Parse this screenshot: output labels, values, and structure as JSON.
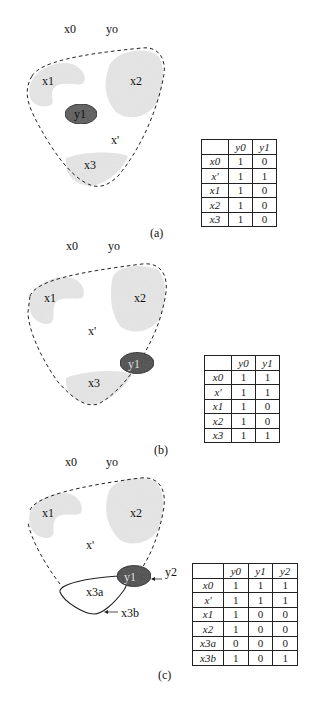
{
  "figure": {
    "panels": [
      {
        "id": "a",
        "caption": "(a)",
        "labels": {
          "x0": "x0",
          "yo": "yo",
          "x1": "x1",
          "x2": "x2",
          "y1": "y1",
          "xprime": "x'",
          "x3": "x3"
        },
        "table": {
          "columns": [
            "",
            "y0",
            "y1"
          ],
          "rows": [
            {
              "row": "x0",
              "values": [
                "1",
                "0"
              ]
            },
            {
              "row": "x'",
              "values": [
                "1",
                "1"
              ]
            },
            {
              "row": "x1",
              "values": [
                "1",
                "0"
              ]
            },
            {
              "row": "x2",
              "values": [
                "1",
                "0"
              ]
            },
            {
              "row": "x3",
              "values": [
                "1",
                "0"
              ]
            }
          ]
        }
      },
      {
        "id": "b",
        "caption": "(b)",
        "labels": {
          "x0": "x0",
          "yo": "yo",
          "x1": "x1",
          "x2": "x2",
          "y1": "y1",
          "xprime": "x'",
          "x3": "x3"
        },
        "table": {
          "columns": [
            "",
            "y0",
            "y1"
          ],
          "rows": [
            {
              "row": "x0",
              "values": [
                "1",
                "1"
              ]
            },
            {
              "row": "x'",
              "values": [
                "1",
                "1"
              ]
            },
            {
              "row": "x1",
              "values": [
                "1",
                "0"
              ]
            },
            {
              "row": "x2",
              "values": [
                "1",
                "0"
              ]
            },
            {
              "row": "x3",
              "values": [
                "1",
                "1"
              ]
            }
          ]
        }
      },
      {
        "id": "c",
        "caption": "(c)",
        "labels": {
          "x0": "x0",
          "yo": "yo",
          "x1": "x1",
          "x2": "x2",
          "y1": "y1",
          "y2": "y2",
          "xprime": "x'",
          "x3a": "x3a",
          "x3b": "x3b"
        },
        "table": {
          "columns": [
            "",
            "y0",
            "y1",
            "y2"
          ],
          "rows": [
            {
              "row": "x0",
              "values": [
                "1",
                "1",
                "1"
              ]
            },
            {
              "row": "x'",
              "values": [
                "1",
                "1",
                "1"
              ]
            },
            {
              "row": "x1",
              "values": [
                "1",
                "0",
                "0"
              ]
            },
            {
              "row": "x2",
              "values": [
                "1",
                "0",
                "0"
              ]
            },
            {
              "row": "x3a",
              "values": [
                "0",
                "0",
                "0"
              ]
            },
            {
              "row": "x3b",
              "values": [
                "1",
                "0",
                "1"
              ]
            }
          ]
        }
      }
    ]
  },
  "colors": {
    "region_fill": "#e6e6e6",
    "y_ellipse_fill": "#5a5a5a",
    "outline": "#222222"
  }
}
